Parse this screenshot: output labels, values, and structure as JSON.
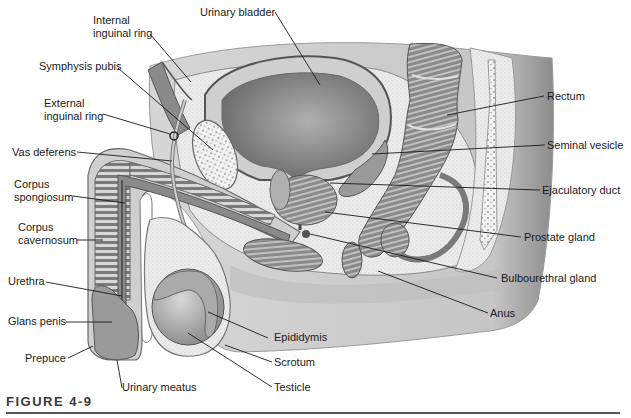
{
  "figure": {
    "caption": "FIGURE 4-9",
    "colors": {
      "skin": "#c9c9c9",
      "skin_dark": "#9a9a9a",
      "tissue_light": "#e6e6e6",
      "tissue_mid": "#8f8f8f",
      "tissue_dark": "#5e5e5e",
      "outline": "#4a4a4a",
      "leader_line": "#1a1a1a",
      "label_text": "#1a1a1a",
      "caption_text": "#3a3a3a"
    }
  },
  "labels": {
    "internal_inguinal_ring": "Internal\ninguinal ring",
    "urinary_bladder": "Urinary bladder",
    "symphysis_pubis": "Symphysis pubis",
    "external_inguinal_ring": "External\ninguinal ring",
    "vas_deferens": "Vas deferens",
    "corpus_spongiosum": "Corpus\nspongiosum",
    "corpus_cavernosum": "Corpus\ncavernosum",
    "urethra": "Urethra",
    "glans_penis": "Glans penis",
    "prepuce": "Prepuce",
    "urinary_meatus": "Urinary meatus",
    "testicle": "Testicle",
    "scrotum": "Scrotum",
    "epididymis": "Epididymis",
    "anus": "Anus",
    "bulbourethral_gland": "Bulbourethral gland",
    "prostate_gland": "Prostate gland",
    "ejaculatory_duct": "Ejaculatory duct",
    "seminal_vesicle": "Seminal vesicle",
    "rectum": "Rectum"
  }
}
